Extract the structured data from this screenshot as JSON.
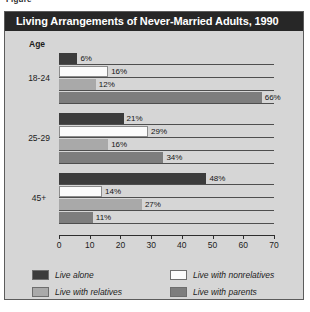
{
  "figure_caption": "Figure",
  "panel": {
    "title": "Living Arrangements of Never-Married Adults, 1990",
    "axis_title": "Age"
  },
  "chart_data": {
    "type": "bar",
    "orientation": "horizontal",
    "title": "Living Arrangements of Never-Married Adults, 1990",
    "xlabel": "",
    "ylabel": "Age",
    "xlim": [
      0,
      70
    ],
    "xticks": [
      0,
      10,
      20,
      30,
      40,
      50,
      60,
      70
    ],
    "grid": false,
    "legend_position": "bottom",
    "categories": [
      "18-24",
      "25-29",
      "45+"
    ],
    "series": [
      {
        "name": "Live alone",
        "color": "#3c3c3c",
        "values": [
          6,
          21,
          48
        ],
        "labels": [
          "6%",
          "21%",
          "48%"
        ]
      },
      {
        "name": "Live with nonrelatives",
        "color": "#fbfbfb",
        "values": [
          16,
          29,
          14
        ],
        "labels": [
          "16%",
          "29%",
          "14%"
        ]
      },
      {
        "name": "Live with relatives",
        "color": "#a9a9a9",
        "values": [
          12,
          16,
          27
        ],
        "labels": [
          "12%",
          "16%",
          "27%"
        ]
      },
      {
        "name": "Live with parents",
        "color": "#7d7d7d",
        "values": [
          66,
          34,
          11
        ],
        "labels": [
          "66%",
          "34%",
          "11%"
        ]
      }
    ]
  },
  "colors": {
    "title_bar": "#272727",
    "panel_background": "#d6d6d6",
    "axis": "#2e2e2e"
  }
}
